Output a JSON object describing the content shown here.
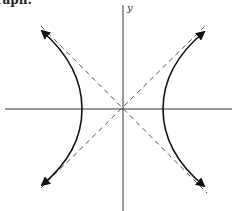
{
  "caption": "Graph:",
  "axes": {
    "y_label": "y",
    "x_label": ""
  },
  "figure": {
    "type": "hyperbola",
    "orientation": "horizontal transverse axis",
    "center": [
      123,
      109
    ],
    "vertices_px": [
      [
        82,
        109
      ],
      [
        163,
        109
      ]
    ],
    "asymptotes": "dashed lines through center",
    "colors": {
      "curve": "#111111",
      "axis": "#333333",
      "asymptote": "#555555"
    }
  }
}
